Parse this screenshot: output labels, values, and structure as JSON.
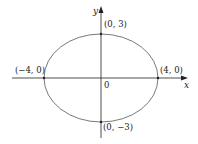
{
  "diagram": {
    "type": "ellipse-graph",
    "equation_implied": "x^2/16 + y^2/9 = 1",
    "colors": {
      "axis": "#222222",
      "curve": "#555555",
      "background": "#ffffff"
    },
    "axes": {
      "x_label": "x",
      "y_label": "y",
      "origin_label": "0"
    },
    "points": [
      {
        "id": "top",
        "label": "(0, 3)"
      },
      {
        "id": "bottom",
        "label": "(0, −3)"
      },
      {
        "id": "left",
        "label": "(−4, 0)"
      },
      {
        "id": "right",
        "label": "(4, 0)"
      }
    ]
  }
}
